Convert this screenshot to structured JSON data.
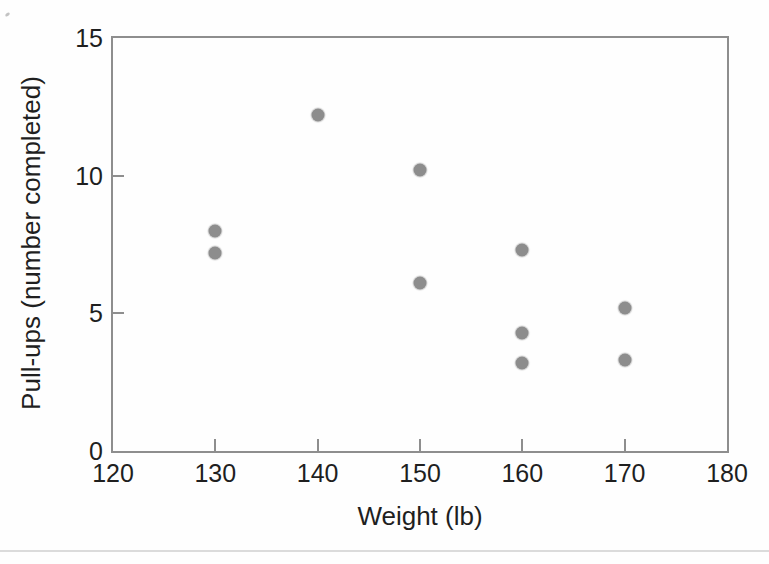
{
  "chart_data": {
    "type": "scatter",
    "title": "",
    "xlabel": "Weight (lb)",
    "ylabel": "Pull-ups (number completed)",
    "xlim": [
      120,
      180
    ],
    "ylim": [
      0,
      15
    ],
    "x_ticks": [
      120,
      130,
      140,
      150,
      160,
      170,
      180
    ],
    "y_ticks": [
      0,
      5,
      10,
      15
    ],
    "grid": false,
    "legend": "none",
    "marker_shape": "circle",
    "marker_color": "#8d8d8d",
    "frame_color": "#8e8e8e",
    "text_color": "#1f1f1f",
    "divider_color": "#dbdbdb",
    "points": [
      {
        "x": 130,
        "y": 8.0
      },
      {
        "x": 130,
        "y": 7.2
      },
      {
        "x": 140,
        "y": 12.2
      },
      {
        "x": 150,
        "y": 10.2
      },
      {
        "x": 150,
        "y": 6.1
      },
      {
        "x": 160,
        "y": 7.3
      },
      {
        "x": 160,
        "y": 4.3
      },
      {
        "x": 160,
        "y": 3.2
      },
      {
        "x": 170,
        "y": 5.2
      },
      {
        "x": 170,
        "y": 3.3
      }
    ]
  }
}
